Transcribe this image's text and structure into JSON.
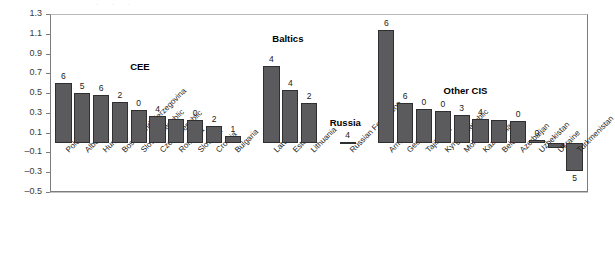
{
  "chart_data": {
    "type": "bar",
    "title": "",
    "xlabel": "",
    "ylabel": "",
    "ylim": [
      -0.5,
      1.3
    ],
    "ytick_step": 0.2,
    "grid": true,
    "legend": "none",
    "yticks": [
      "1.3",
      "1.1",
      "0.9",
      "0.7",
      "0.5",
      "0.3",
      "0.1",
      "-0.1",
      "-0.3",
      "-0.5"
    ],
    "bar_color": "#5b5b5d",
    "bar_edge_color": "#2f2f31",
    "group_labels": [
      "CEE",
      "Baltics",
      "Russia",
      "Other CIS"
    ],
    "categories": [
      "Poland",
      "Albania",
      "Hungary",
      "Bosnia and Herzegovina",
      "Slovak Republic",
      "Czech Republic",
      "Romania",
      "Slovenia",
      "Croatia",
      "Bulgaria",
      "Latvia",
      "Estonia",
      "Lithuania",
      "Russian Federation",
      "Armenia",
      "Georgia",
      "Tajikistan",
      "Kyrgyz Republic",
      "Moldova",
      "Kazakhstan",
      "Belarus",
      "Azerbaijan",
      "Uzbekistan",
      "Ukraine",
      "Turkmenistan"
    ],
    "values": [
      0.6,
      0.5,
      0.48,
      0.41,
      0.33,
      0.27,
      0.24,
      0.23,
      0.17,
      0.07,
      0.77,
      0.53,
      0.4,
      0.01,
      1.14,
      0.4,
      0.34,
      0.32,
      0.28,
      0.24,
      0.23,
      0.22,
      0.03,
      -0.06,
      -0.29
    ],
    "data_labels": [
      "6",
      "5",
      "6",
      "2",
      "0",
      "4",
      "",
      "0",
      "2",
      "1",
      "4",
      "4",
      "2",
      "4",
      "6",
      "6",
      "0",
      "0",
      "3",
      "4",
      "",
      "0",
      "0",
      "",
      "5"
    ]
  }
}
